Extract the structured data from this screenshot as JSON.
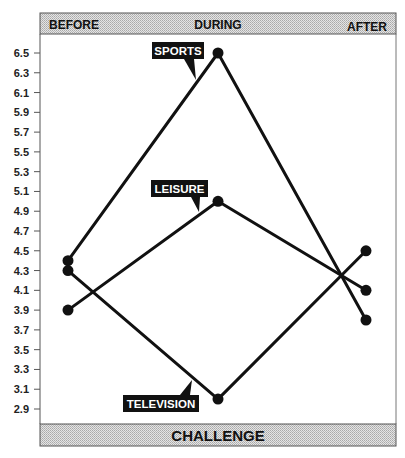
{
  "header": {
    "labels": [
      "BEFORE",
      "DURING",
      "AFTER"
    ]
  },
  "footer": {
    "label": "CHALLENGE"
  },
  "chart_data": {
    "type": "line",
    "title": "",
    "xlabel": "CHALLENGE",
    "ylabel": "",
    "categories": [
      "BEFORE",
      "DURING",
      "AFTER"
    ],
    "yticks": [
      "6.5",
      "6.3",
      "6.1",
      "5.9",
      "5.7",
      "5.5",
      "5.3",
      "5.1",
      "4.9",
      "4.7",
      "4.5",
      "4.3",
      "4.1",
      "3.9",
      "3.7",
      "3.5",
      "3.3",
      "3.1",
      "2.9"
    ],
    "ylim": [
      2.8,
      6.6
    ],
    "grid": false,
    "series": [
      {
        "name": "SPORTS",
        "values": [
          4.4,
          6.5,
          3.8
        ]
      },
      {
        "name": "LEISURE",
        "values": [
          3.9,
          5.0,
          4.1
        ]
      },
      {
        "name": "TELEVISION",
        "values": [
          4.3,
          3.0,
          4.5
        ]
      }
    ],
    "annotations": [
      {
        "text": "SPORTS",
        "target": "DURING"
      },
      {
        "text": "LEISURE",
        "target": "DURING"
      },
      {
        "text": "TELEVISION",
        "target": "DURING"
      }
    ]
  }
}
